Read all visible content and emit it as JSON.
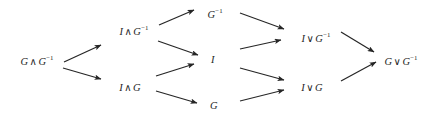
{
  "figure": {
    "type": "directed-graph",
    "title": "",
    "background_color": "#ffffff",
    "ink_color": "#262626",
    "width": 432,
    "height": 120
  },
  "nodes": [
    {
      "id": "n1",
      "label": "G ∧ G⁻¹",
      "base": "G",
      "op": "∧",
      "operand": "G",
      "superscript": "−1",
      "x": 37,
      "y": 61,
      "column": 1
    },
    {
      "id": "n2",
      "label": "I ∧ G⁻¹",
      "base": "I",
      "op": "∧",
      "operand": "G",
      "superscript": "−1",
      "x": 134,
      "y": 31,
      "column": 2
    },
    {
      "id": "n3",
      "label": "I ∧ G",
      "base": "I",
      "op": "∧",
      "operand": "G",
      "superscript": "",
      "x": 130,
      "y": 88,
      "column": 2
    },
    {
      "id": "n4",
      "label": "G⁻¹",
      "base": "",
      "op": "",
      "operand": "G",
      "superscript": "−1",
      "x": 215,
      "y": 14,
      "column": 3
    },
    {
      "id": "n5",
      "label": "I",
      "base": "",
      "op": "",
      "operand": "I",
      "superscript": "",
      "x": 213,
      "y": 60,
      "column": 3
    },
    {
      "id": "n6",
      "label": "G",
      "base": "",
      "op": "",
      "operand": "G",
      "superscript": "",
      "x": 214,
      "y": 106,
      "column": 3
    },
    {
      "id": "n7",
      "label": "I ∨ G⁻¹",
      "base": "I",
      "op": "∨",
      "operand": "G",
      "superscript": "−1",
      "x": 316,
      "y": 38,
      "column": 4
    },
    {
      "id": "n8",
      "label": "I ∨ G",
      "base": "I",
      "op": "∨",
      "operand": "G",
      "superscript": "",
      "x": 312,
      "y": 88,
      "column": 4
    },
    {
      "id": "n9",
      "label": "G ∨ G⁻¹",
      "base": "G",
      "op": "∨",
      "operand": "G",
      "superscript": "−1",
      "x": 401,
      "y": 61,
      "column": 5
    }
  ],
  "edges": [
    {
      "id": "e1",
      "from": "n1",
      "to": "n2",
      "x1": 64,
      "y1": 62,
      "x2": 101,
      "y2": 45
    },
    {
      "id": "e2",
      "from": "n1",
      "to": "n3",
      "x1": 63,
      "y1": 68,
      "x2": 101,
      "y2": 79
    },
    {
      "id": "e3",
      "from": "n2",
      "to": "n4",
      "x1": 159,
      "y1": 25,
      "x2": 194,
      "y2": 10
    },
    {
      "id": "e4",
      "from": "n2",
      "to": "n5",
      "x1": 158,
      "y1": 41,
      "x2": 198,
      "y2": 55
    },
    {
      "id": "e5",
      "from": "n3",
      "to": "n5",
      "x1": 156,
      "y1": 76,
      "x2": 194,
      "y2": 64
    },
    {
      "id": "e6",
      "from": "n3",
      "to": "n6",
      "x1": 156,
      "y1": 91,
      "x2": 197,
      "y2": 103
    },
    {
      "id": "e7",
      "from": "n4",
      "to": "n7",
      "x1": 240,
      "y1": 13,
      "x2": 284,
      "y2": 29
    },
    {
      "id": "e8",
      "from": "n5",
      "to": "n7",
      "x1": 240,
      "y1": 49,
      "x2": 281,
      "y2": 40
    },
    {
      "id": "e9",
      "from": "n5",
      "to": "n8",
      "x1": 240,
      "y1": 68,
      "x2": 284,
      "y2": 80
    },
    {
      "id": "e10",
      "from": "n6",
      "to": "n8",
      "x1": 240,
      "y1": 101,
      "x2": 284,
      "y2": 90
    },
    {
      "id": "e11",
      "from": "n7",
      "to": "n9",
      "x1": 341,
      "y1": 32,
      "x2": 374,
      "y2": 52
    },
    {
      "id": "e12",
      "from": "n8",
      "to": "n9",
      "x1": 341,
      "y1": 81,
      "x2": 376,
      "y2": 62
    }
  ]
}
